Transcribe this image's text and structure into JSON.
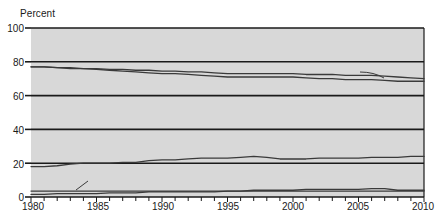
{
  "chart_data": {
    "type": "line",
    "title": "",
    "xlabel": "",
    "ylabel": "Percent",
    "ylim": [
      0,
      100
    ],
    "xlim": [
      1980,
      2010
    ],
    "yticks": [
      0,
      20,
      40,
      60,
      80,
      100
    ],
    "xticks": [
      1980,
      1985,
      1990,
      1995,
      2000,
      2005,
      2010
    ],
    "xtick_minor_interval": 1,
    "grid": "horizontal",
    "legend_position": "inline-annotations",
    "plot_background": "#d8d8d8",
    "line_color": "#3a3a3a",
    "gridline_color": "#1a1a1a",
    "x": [
      1980,
      1981,
      1982,
      1983,
      1984,
      1985,
      1986,
      1987,
      1988,
      1989,
      1990,
      1991,
      1992,
      1993,
      1994,
      1995,
      1996,
      1997,
      1998,
      1999,
      2000,
      2001,
      2002,
      2003,
      2004,
      2005,
      2006,
      2007,
      2008,
      2009,
      2010
    ],
    "series": [
      {
        "name": "Two married parents",
        "label": "Two married parents",
        "label_suffix": "",
        "values": [
          77,
          77,
          76.5,
          76,
          76,
          75.5,
          75,
          74.5,
          74,
          73.5,
          73,
          73,
          72.5,
          72,
          71.5,
          71,
          71,
          71,
          71,
          71,
          71,
          70.5,
          70,
          70,
          69.5,
          69.5,
          69.5,
          69,
          68.5,
          68.5,
          68.5
        ]
      },
      {
        "name": "Two parents",
        "label": "Two parents",
        "label_suffix": "a",
        "values": [
          77,
          77,
          76.5,
          76.5,
          76,
          76,
          75.5,
          75.5,
          75,
          75,
          74.5,
          74.5,
          74,
          74,
          73.5,
          73,
          73,
          73,
          73,
          73,
          73,
          72.5,
          72.5,
          72.5,
          72,
          72,
          72,
          71.5,
          71,
          70.5,
          70
        ]
      },
      {
        "name": "Mother only",
        "label": "Mother only",
        "label_suffix": "",
        "values": [
          18,
          18,
          18.5,
          19.5,
          20,
          20,
          20,
          20.5,
          20.5,
          21.5,
          22,
          22,
          22.5,
          23,
          23,
          23,
          23.5,
          24,
          23.5,
          22.5,
          22.5,
          22.5,
          23,
          23,
          23,
          23,
          23.5,
          23.5,
          23.5,
          24,
          24
        ]
      },
      {
        "name": "Father only",
        "label": "Father only",
        "label_suffix": "",
        "values": [
          1.5,
          1.5,
          2,
          2,
          2,
          2,
          2.5,
          2.5,
          2.5,
          3,
          3,
          3,
          3,
          3,
          3,
          3.5,
          3.5,
          4,
          4,
          4,
          4,
          4.5,
          4.5,
          4.5,
          4.5,
          4.5,
          5,
          5,
          4,
          4,
          4
        ]
      },
      {
        "name": "No parent",
        "label": "No parent",
        "label_suffix": "",
        "values": [
          3.5,
          3.5,
          3.5,
          3.5,
          3.5,
          3.5,
          3.5,
          3.5,
          3.5,
          3.5,
          3.5,
          3.5,
          3.5,
          3.5,
          3.5,
          3.5,
          3.5,
          3.5,
          3.5,
          3.5,
          3.5,
          3.5,
          3.5,
          3.5,
          3.5,
          3.5,
          3.5,
          3.5,
          3.5,
          3.5,
          3.5
        ]
      }
    ],
    "annotations": [
      {
        "text": "Two married parents",
        "x": 1980.5,
        "y": 70
      },
      {
        "text": "Two parents",
        "suffix": "a",
        "x": 2001.5,
        "y": 80
      },
      {
        "text": "Mother only",
        "x": 1981,
        "y": 28
      },
      {
        "text": "No parent",
        "x": 1980.2,
        "y": 10
      },
      {
        "text": "Father only",
        "x": 1984.5,
        "y": 10
      }
    ]
  },
  "axis": {
    "y_title": "Percent",
    "ytick_labels": [
      "100",
      "80",
      "60",
      "40",
      "20",
      "0"
    ],
    "xtick_labels": [
      "1980",
      "1985",
      "1990",
      "1995",
      "2000",
      "2005",
      "2010"
    ]
  },
  "labels": {
    "two_married_parents": "Two married parents",
    "two_parents": "Two parents",
    "two_parents_sup": "a",
    "mother_only": "Mother only",
    "no_parent": "No parent",
    "father_only": "Father only"
  }
}
